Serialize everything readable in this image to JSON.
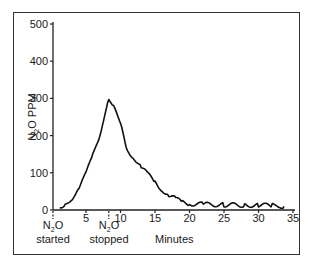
{
  "chart_data": {
    "type": "line",
    "title": "",
    "xlabel": "Minutes",
    "ylabel": "N2O PPM",
    "xlim": [
      0,
      35
    ],
    "ylim": [
      0,
      500
    ],
    "x_ticks": [
      5,
      10,
      15,
      20,
      25,
      30,
      35
    ],
    "y_ticks": [
      0,
      100,
      200,
      300,
      400,
      500
    ],
    "grid": false,
    "legend": null,
    "annotations": [
      {
        "x": 0,
        "label_line1": "N2O",
        "label_line2": "started",
        "marker": "dashed-tick"
      },
      {
        "x": 8.3,
        "label_line1": "N2O",
        "label_line2": "stopped",
        "marker": "dashed-tick"
      }
    ],
    "series": [
      {
        "name": "N2O concentration",
        "x": [
          1.2,
          2,
          3,
          4,
          5,
          6,
          7,
          7.5,
          8,
          8.3,
          9,
          10,
          11,
          12,
          13,
          14,
          15,
          16,
          17,
          18,
          19,
          20,
          22,
          25,
          28,
          30,
          32,
          33.7
        ],
        "values": [
          5,
          15,
          30,
          60,
          100,
          150,
          200,
          240,
          280,
          300,
          280,
          230,
          160,
          140,
          115,
          95,
          75,
          55,
          40,
          30,
          20,
          17,
          15,
          14,
          13,
          13,
          12,
          10
        ]
      }
    ]
  },
  "labels": {
    "y_axis_main": "N",
    "y_axis_sub": "2",
    "y_axis_rest": "O PPM",
    "x_axis": "Minutes",
    "started_main": "N",
    "started_sub": "2",
    "started_rest": "O",
    "started_word": "started",
    "stopped_main": "N",
    "stopped_sub": "2",
    "stopped_rest": "O",
    "stopped_word": "stopped"
  },
  "y_tick_labels": [
    "0",
    "100",
    "200",
    "300",
    "400",
    "500"
  ],
  "x_tick_labels": [
    "5",
    "10",
    "15",
    "20",
    "25",
    "30",
    "35"
  ]
}
